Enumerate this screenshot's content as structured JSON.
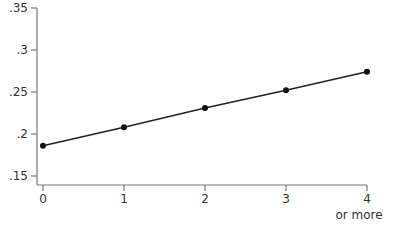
{
  "chart_data": {
    "type": "line",
    "title": "",
    "xlabel": "",
    "ylabel": "",
    "categories": [
      "0",
      "1",
      "2",
      "3",
      "4"
    ],
    "category_sublabels": [
      "",
      "",
      "",
      "",
      "or more"
    ],
    "x": [
      0,
      1,
      2,
      3,
      4
    ],
    "series": [
      {
        "name": "series",
        "values": [
          0.186,
          0.208,
          0.231,
          0.252,
          0.274
        ],
        "markers": true
      }
    ],
    "ylim": [
      0.15,
      0.35
    ],
    "yticks": [
      0.15,
      0.2,
      0.25,
      0.3,
      0.35
    ],
    "ytick_labels": [
      ".15",
      ".2",
      ".25",
      ".3",
      ".35"
    ],
    "grid": false,
    "legend": null
  },
  "style": {
    "axis_color": "#777777",
    "line_color": "#222222",
    "marker_color": "#111111",
    "text_color": "#333333"
  }
}
